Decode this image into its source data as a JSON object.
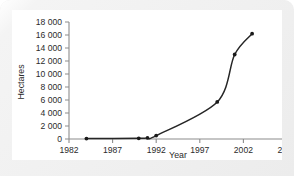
{
  "chart_data": {
    "type": "line",
    "title": "",
    "subtitle": "",
    "xlabel": "Year",
    "ylabel": "Hectares",
    "xlim": [
      1982,
      2007
    ],
    "ylim": [
      0,
      18000
    ],
    "grid": false,
    "legend": false,
    "legend_position": "none",
    "xticks": [
      1982,
      1987,
      1992,
      1997,
      2002,
      2007
    ],
    "xtick_labels": [
      "1982",
      "1987",
      "1992",
      "1997",
      "2002",
      "2007"
    ],
    "yticks": [
      0,
      2000,
      4000,
      6000,
      8000,
      10000,
      12000,
      14000,
      16000,
      18000
    ],
    "ytick_labels": [
      "0",
      "2 000",
      "4 000",
      "6 000",
      "8 000",
      "10 000",
      "12 000",
      "14 000",
      "16 000",
      "18 000"
    ],
    "series": [
      {
        "name": "Hectares",
        "marker": "circle",
        "color": "#1a1a1a",
        "x": [
          1984,
          1990,
          1991,
          1992,
          1999,
          2001,
          2003
        ],
        "values": [
          60,
          100,
          180,
          520,
          5700,
          13000,
          16200
        ]
      }
    ]
  },
  "axes": {
    "x_axis_label": "Year",
    "y_axis_label": "Hectares"
  },
  "colors": {
    "line": "#1a1a1a",
    "axis": "#8c8c8c",
    "text": "#2b2b2b",
    "panel_background": "#ffffff",
    "card_background": "#efefef"
  }
}
